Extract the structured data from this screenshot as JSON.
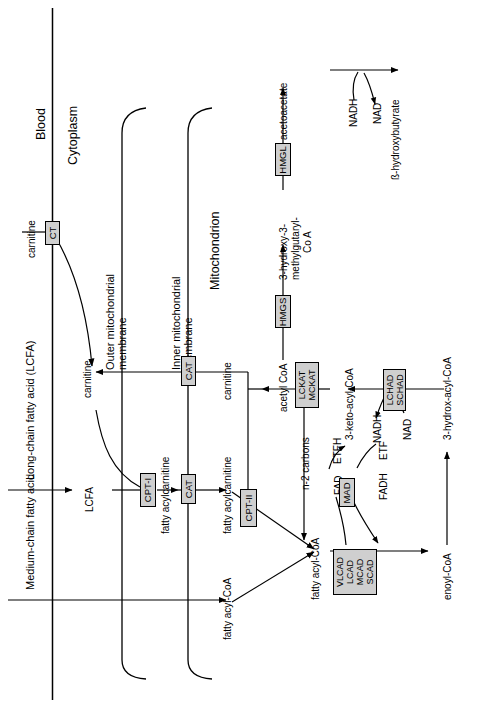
{
  "diagram": {
    "compartments": [
      {
        "id": "blood",
        "label": "Blood"
      },
      {
        "id": "cytoplasm",
        "label": "Cytoplasm"
      },
      {
        "id": "mitochondrion",
        "label": "Mitochondrion"
      }
    ],
    "membranes": [
      {
        "id": "outer",
        "label": "Outer mitochondrial\nmembrane",
        "line1": "Outer mitochondrial",
        "line2": "membrane"
      },
      {
        "id": "inner",
        "label": "Inner mitochondrial\nmembrane",
        "line1": "Inner mitochondrial",
        "line2": "membrane"
      }
    ],
    "substrates": {
      "carnitine_blood": "carnitine",
      "lcfa_blood": "Long-chain fatty acid (LCFA)",
      "mcfa_blood": "Medium-chain fatty acid",
      "lcfa_cyto": "LCFA",
      "carnitine_cyto": "carnitine",
      "fatty_acylcarnitine_cyto": "fatty acylcarnitine",
      "fatty_acylcarnitine_mito": "fatty acylcarnitine",
      "fatty_acyl_coa_mcfa": "fatty acyl-CoA",
      "carnitine_mito": "carnitine",
      "fatty_acyl_coa": "fatty acyl-CoA",
      "enoyl_coa": "enoyl-CoA",
      "hydroxy_acyl_coa": "3-hydrox-acyl-CoA",
      "keto_acyl_coa": "3-keto-acyl-CoA",
      "acetyl_coa": "acetyl CoA",
      "hmg_coa_line1": "3-hydroxy-3-",
      "hmg_coa_line2": "methylgutaryl-",
      "hmg_coa_line3": "Co A",
      "acetoacetate": "acetoacetate",
      "beta_hydroxybutyrate": "ß-hydroxybutyrate",
      "n_minus_2": "n-2 carbons"
    },
    "cofactors": {
      "fad": "FAD",
      "fadh": "FADH",
      "etf": "ETF",
      "etfh": "ETFH",
      "nad_hydrox": "NAD",
      "nadh_hydrox": "NADH",
      "nad_keto": "NAD",
      "nadh_keto": "NADH",
      "nadh_ketone": "NADH",
      "nad_ketone": "NAD"
    },
    "enzymes": [
      {
        "id": "ct",
        "lines": [
          "CT"
        ]
      },
      {
        "id": "cpt1",
        "lines": [
          "CPT-I"
        ]
      },
      {
        "id": "cat-outer",
        "lines": [
          "CAT"
        ]
      },
      {
        "id": "cat-inner",
        "lines": [
          "CAT"
        ]
      },
      {
        "id": "cpt2",
        "lines": [
          "CPT-II"
        ]
      },
      {
        "id": "acyl-dehydrogenases",
        "lines": [
          "VLCAD",
          "LCAD",
          "MCAD",
          "SCAD"
        ]
      },
      {
        "id": "mad",
        "lines": [
          "MAD"
        ]
      },
      {
        "id": "hydratase-dehydrogenases",
        "lines": [
          "LCHAD",
          "SCHAD"
        ]
      },
      {
        "id": "thiolases",
        "lines": [
          "LCKAT",
          "MCKAT"
        ]
      },
      {
        "id": "hmgs",
        "lines": [
          "HMGS"
        ]
      },
      {
        "id": "hmgl",
        "lines": [
          "HMGL"
        ]
      }
    ],
    "colors": {
      "enzyme_box_fill": "#cfcfcf",
      "stroke": "#000000",
      "background": "#ffffff"
    }
  }
}
